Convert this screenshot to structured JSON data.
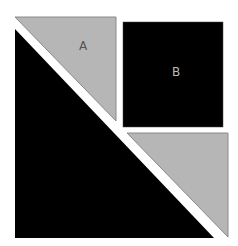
{
  "diagram": {
    "colors": {
      "background": "#ffffff",
      "gray_fill": "#b6b6b6",
      "gray_stroke": "#8a8a8a",
      "black_fill": "#000000",
      "label_on_gray": "#555555",
      "label_on_black": "#bdbdbd"
    },
    "shapes": [
      {
        "id": "triangle-a",
        "type": "triangle",
        "fill": "gray",
        "points": "15,17 116,17 116,121",
        "label": "A",
        "label_pos": [
          83,
          50
        ]
      },
      {
        "id": "square-b",
        "type": "square",
        "fill": "black",
        "x": 123,
        "y": 22,
        "width": 100,
        "height": 105,
        "label": "B",
        "label_pos": [
          176,
          76
        ]
      },
      {
        "id": "triangle-lower-right",
        "type": "triangle",
        "fill": "gray",
        "points": "127,133 228,133 228,237",
        "label": ""
      },
      {
        "id": "triangle-large-black",
        "type": "triangle",
        "fill": "black",
        "points": "15,29 15,238 214,238",
        "label": ""
      }
    ]
  }
}
